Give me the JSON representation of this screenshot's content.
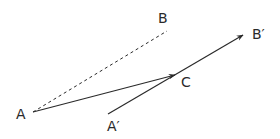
{
  "diagram": {
    "labels": {
      "A": "A",
      "B": "B",
      "C": "C",
      "B_prime": "B′",
      "A_prime": "A′"
    },
    "segments": [
      {
        "from": "A",
        "to": "B",
        "style": "dashed"
      },
      {
        "from": "A",
        "to": "C",
        "style": "solid",
        "arrow": "end"
      },
      {
        "from": "A′",
        "to": "B′",
        "style": "solid",
        "arrow": "end",
        "through": "C"
      }
    ],
    "colors": {
      "stroke": "#2a2a2a",
      "background": "#ffffff"
    }
  }
}
